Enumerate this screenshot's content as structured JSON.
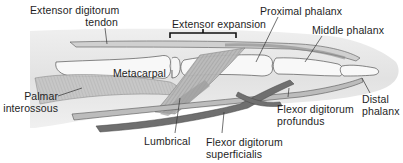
{
  "diagram": {
    "labels": [
      {
        "id": "extensor-digitorum-tendon",
        "lines": [
          "Extensor digitorum",
          "tendon"
        ]
      },
      {
        "id": "extensor-expansion",
        "lines": [
          "Extensor expansion"
        ]
      },
      {
        "id": "proximal-phalanx",
        "lines": [
          "Proximal phalanx"
        ]
      },
      {
        "id": "middle-phalanx",
        "lines": [
          "Middle phalanx"
        ]
      },
      {
        "id": "metacarpal",
        "lines": [
          "Metacarpal"
        ]
      },
      {
        "id": "palmar-interossous",
        "lines": [
          "Palmar",
          "interossous"
        ]
      },
      {
        "id": "lumbrical",
        "lines": [
          "Lumbrical"
        ]
      },
      {
        "id": "flexor-digitorum-superficialis",
        "lines": [
          "Flexor digitorum",
          "superficialis"
        ]
      },
      {
        "id": "flexor-digitorum-profundus",
        "lines": [
          "Flexor digitorum",
          "profundus"
        ]
      },
      {
        "id": "distal-phalanx",
        "lines": [
          "Distal",
          "phalanx"
        ]
      }
    ],
    "colors": {
      "skin": "#e6e6e6",
      "bone": "#f7f7f7",
      "bone_outline": "#555555",
      "tendon_light": "#b9b9b9",
      "tendon_dark": "#6e6e6e",
      "muscle": "#a8a8a8",
      "leader_line": "#333333"
    }
  }
}
